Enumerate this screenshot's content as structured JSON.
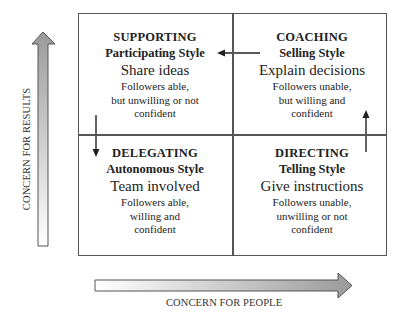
{
  "diagram": {
    "type": "2x2 situational leadership matrix",
    "quadrants": [
      {
        "id": "supporting",
        "position": "top-left",
        "name": "SUPPORTING",
        "style": "Participating Style",
        "action": "Share ideas",
        "description": [
          "Followers able,",
          "but unwilling or not",
          "confident"
        ]
      },
      {
        "id": "coaching",
        "position": "top-right",
        "name": "COACHING",
        "style": "Selling Style",
        "action": "Explain decisions",
        "description": [
          "Followers unable,",
          "but willing and",
          "confident"
        ]
      },
      {
        "id": "delegating",
        "position": "bottom-left",
        "name": "DELEGATING",
        "style": "Autonomous Style",
        "action": "Team involved",
        "description": [
          "Followers able,",
          "willing and",
          "confident"
        ]
      },
      {
        "id": "directing",
        "position": "bottom-right",
        "name": "DIRECTING",
        "style": "Telling Style",
        "action": "Give instructions",
        "description": [
          "Followers unable,",
          "unwilling or not",
          "confident"
        ]
      }
    ],
    "flow_arrows": [
      {
        "from": "directing",
        "to": "coaching",
        "direction": "up"
      },
      {
        "from": "coaching",
        "to": "supporting",
        "direction": "left"
      },
      {
        "from": "supporting",
        "to": "delegating",
        "direction": "down"
      }
    ],
    "axes": {
      "y": {
        "label": "CONCERN FOR RESULTS",
        "direction": "up"
      },
      "x": {
        "label": "CONCERN FOR PEOPLE",
        "direction": "right"
      }
    },
    "colors": {
      "line": "#555555",
      "text": "#222222",
      "arrow_dark": "#9a9a9a",
      "arrow_light": "#ffffff"
    }
  }
}
